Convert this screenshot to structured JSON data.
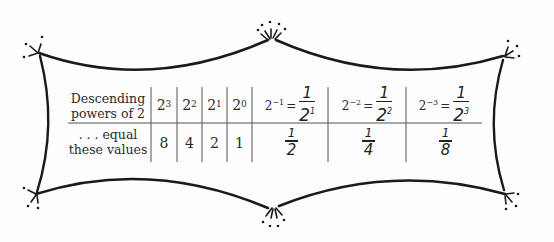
{
  "table": {
    "row1_label": [
      "Descending",
      "powers of 2"
    ],
    "row2_label": [
      ". . . equal",
      "these values"
    ],
    "powers": [
      {
        "base": "2",
        "exp": "3"
      },
      {
        "base": "2",
        "exp": "2"
      },
      {
        "base": "2",
        "exp": "1"
      },
      {
        "base": "2",
        "exp": "0"
      }
    ],
    "negative_powers": [
      {
        "base": "2",
        "exp": "−1",
        "equals": "=",
        "num": "1",
        "den_base": "2",
        "den_exp": "1"
      },
      {
        "base": "2",
        "exp": "−2",
        "equals": "=",
        "num": "1",
        "den_base": "2",
        "den_exp": "2"
      },
      {
        "base": "2",
        "exp": "−3",
        "equals": "=",
        "num": "1",
        "den_base": "2",
        "den_exp": "3"
      }
    ],
    "values": [
      "8",
      "4",
      "2",
      "1"
    ],
    "fraction_values": [
      {
        "num": "1",
        "den": "2"
      },
      {
        "num": "1",
        "den": "4"
      },
      {
        "num": "1",
        "den": "8"
      }
    ]
  },
  "decoration": {
    "frame": "hand-drawn-ornamental-border",
    "line_color": "#1a1a1a"
  }
}
